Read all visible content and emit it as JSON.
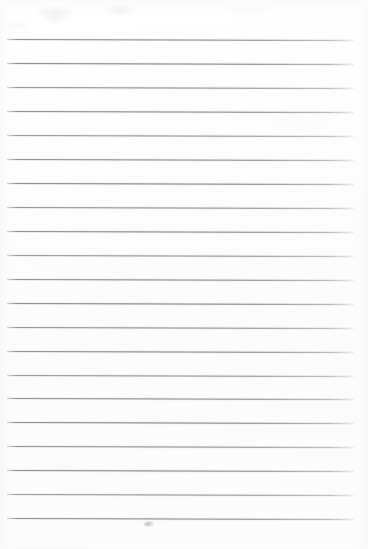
{
  "document": {
    "kind": "scanned-lined-paper",
    "title": "Blank Ruled Notebook Page",
    "width": 368,
    "height": 549,
    "text_content": "",
    "is_blank": true
  },
  "paper": {
    "background_color": "#fefefe",
    "edge_color": "#ffffff",
    "has_vertical_margin_rule": false,
    "has_holes": false,
    "has_header": false,
    "has_page_number": false
  },
  "ruling": {
    "line_color": "#707078",
    "line_thickness_px": 1,
    "line_count": 21,
    "first_line_y": 39,
    "line_spacing_px": 24,
    "left_x": 7,
    "right_x": 354,
    "tilt_deg": 0.18,
    "lines": [
      {
        "index": 1,
        "y": 39,
        "x1": 7,
        "x2": 354
      },
      {
        "index": 2,
        "y": 63,
        "x1": 7,
        "x2": 354
      },
      {
        "index": 3,
        "y": 87,
        "x1": 7,
        "x2": 354
      },
      {
        "index": 4,
        "y": 111,
        "x1": 7,
        "x2": 354
      },
      {
        "index": 5,
        "y": 135,
        "x1": 7,
        "x2": 354
      },
      {
        "index": 6,
        "y": 159,
        "x1": 7,
        "x2": 354
      },
      {
        "index": 7,
        "y": 183,
        "x1": 7,
        "x2": 354
      },
      {
        "index": 8,
        "y": 207,
        "x1": 7,
        "x2": 354
      },
      {
        "index": 9,
        "y": 231,
        "x1": 7,
        "x2": 354
      },
      {
        "index": 10,
        "y": 255,
        "x1": 7,
        "x2": 354
      },
      {
        "index": 11,
        "y": 279,
        "x1": 7,
        "x2": 354
      },
      {
        "index": 12,
        "y": 303,
        "x1": 7,
        "x2": 354
      },
      {
        "index": 13,
        "y": 327,
        "x1": 7,
        "x2": 354
      },
      {
        "index": 14,
        "y": 351,
        "x1": 7,
        "x2": 354
      },
      {
        "index": 15,
        "y": 375,
        "x1": 7,
        "x2": 354
      },
      {
        "index": 16,
        "y": 398,
        "x1": 7,
        "x2": 354
      },
      {
        "index": 17,
        "y": 422,
        "x1": 7,
        "x2": 354
      },
      {
        "index": 18,
        "y": 446,
        "x1": 7,
        "x2": 354
      },
      {
        "index": 19,
        "y": 470,
        "x1": 7,
        "x2": 354
      },
      {
        "index": 20,
        "y": 494,
        "x1": 7,
        "x2": 354
      },
      {
        "index": 21,
        "y": 518,
        "x1": 7,
        "x2": 354
      }
    ]
  },
  "marks": [
    {
      "name": "pencil-smudge",
      "x": 144,
      "y": 521,
      "width": 10,
      "height": 6,
      "color": "#78787e"
    }
  ]
}
